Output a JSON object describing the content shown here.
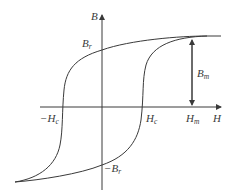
{
  "diagram": {
    "type": "hysteresis-loop",
    "axes": {
      "x_label": "H",
      "y_label": "B"
    },
    "labels": {
      "br_pos": {
        "main": "B",
        "sub": "r"
      },
      "br_neg": {
        "prefix": "−",
        "main": "B",
        "sub": "r"
      },
      "hc_pos": {
        "main": "H",
        "sub": "c"
      },
      "hc_neg": {
        "prefix": "−",
        "main": "H",
        "sub": "c"
      },
      "hm": {
        "main": "H",
        "sub": "m"
      },
      "bm": {
        "main": "B",
        "sub": "m"
      }
    },
    "colors": {
      "line": "#3a3a3a",
      "background": "#ffffff"
    }
  }
}
